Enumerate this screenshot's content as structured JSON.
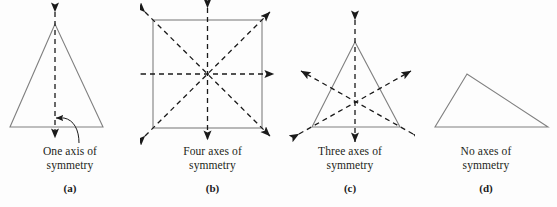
{
  "figure": {
    "background_color": "#fdfdfd",
    "shape_stroke_color": "#808080",
    "axis_stroke_color": "#1a1a1a",
    "text_color": "#231f20"
  },
  "panels": [
    {
      "id": "a",
      "label": "(a)",
      "shape": "isosceles-triangle",
      "axis_count": 1,
      "caption_line1": "One axis of",
      "caption_line2": "symmetry",
      "caption_full": "One axis of symmetry",
      "has_leader_line": true
    },
    {
      "id": "b",
      "label": "(b)",
      "shape": "square",
      "axis_count": 4,
      "caption_line1": "Four axes of",
      "caption_line2": "symmetry",
      "caption_full": "Four axes of symmetry",
      "has_leader_line": false
    },
    {
      "id": "c",
      "label": "(c)",
      "shape": "equilateral-triangle",
      "axis_count": 3,
      "caption_line1": "Three axes of",
      "caption_line2": "symmetry",
      "caption_full": "Three axes of symmetry",
      "has_leader_line": false
    },
    {
      "id": "d",
      "label": "(d)",
      "shape": "scalene-triangle",
      "axis_count": 0,
      "caption_line1": "No axes of",
      "caption_line2": "symmetry",
      "caption_full": "No axes of symmetry",
      "has_leader_line": false
    }
  ]
}
